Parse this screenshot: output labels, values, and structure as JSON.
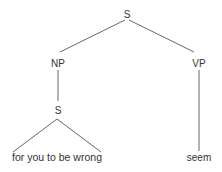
{
  "diagram": {
    "type": "syntax-tree",
    "colors": {
      "line": "#555555",
      "text": "#333333",
      "background": "#ffffff"
    },
    "nodes": {
      "root": {
        "label": "S"
      },
      "np": {
        "label": "NP"
      },
      "vp": {
        "label": "VP"
      },
      "embedded_s": {
        "label": "S"
      },
      "np_leaf": {
        "label": "for you to be wrong",
        "abbreviated": true
      },
      "vp_leaf": {
        "label": "seem"
      }
    },
    "edges": [
      {
        "from": "S",
        "to": "NP"
      },
      {
        "from": "S",
        "to": "VP"
      },
      {
        "from": "NP",
        "to": "S"
      },
      {
        "from": "S",
        "to": "for you to be wrong",
        "style": "triangle"
      },
      {
        "from": "VP",
        "to": "seem"
      }
    ]
  }
}
